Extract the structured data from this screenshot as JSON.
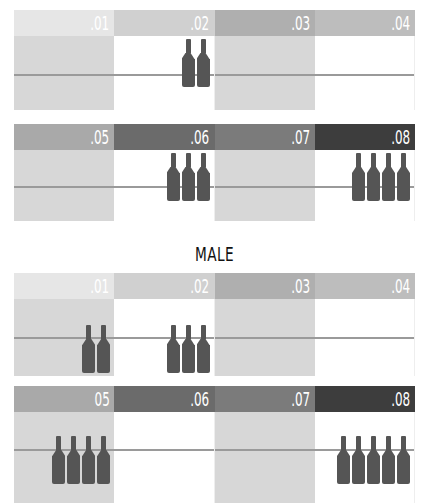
{
  "chart_data": [
    {
      "type": "pictogram",
      "title": "(clipped, unreadable)",
      "icon": "bottle-icon",
      "categories": [
        ".01",
        ".02",
        ".03",
        ".04",
        ".05",
        ".06",
        ".07",
        ".08"
      ],
      "values": [
        0,
        2,
        0,
        0,
        0,
        3,
        0,
        4
      ]
    },
    {
      "type": "pictogram",
      "title": "MALE",
      "icon": "bottle-icon",
      "categories": [
        ".01",
        ".02",
        ".03",
        ".04",
        ".05",
        ".06",
        ".07",
        ".08"
      ],
      "values": [
        2,
        3,
        0,
        0,
        4,
        0,
        0,
        5
      ]
    }
  ],
  "colors": {
    "bottle": "#555555",
    "shaded_body": "#d7d7d7",
    "midline": "#9a9a9a",
    "headers": [
      "#e6e6e6",
      "#d0d0d0",
      "#afafaf",
      "#bdbdbd",
      "#a9a9a9",
      "#6b6b6b",
      "#7b7b7b",
      "#3d3d3d"
    ]
  },
  "female": {
    "title": "",
    "row1": [
      {
        "label": ".01",
        "bottles": 0
      },
      {
        "label": ".02",
        "bottles": 2
      },
      {
        "label": ".03",
        "bottles": 0
      },
      {
        "label": ".04",
        "bottles": 0
      }
    ],
    "row2": [
      {
        "label": ".05",
        "bottles": 0
      },
      {
        "label": ".06",
        "bottles": 3
      },
      {
        "label": ".07",
        "bottles": 0
      },
      {
        "label": ".08",
        "bottles": 4
      }
    ]
  },
  "male": {
    "title": "MALE",
    "row1": [
      {
        "label": ".01",
        "bottles": 2
      },
      {
        "label": ".02",
        "bottles": 3
      },
      {
        "label": ".03",
        "bottles": 0
      },
      {
        "label": ".04",
        "bottles": 0
      }
    ],
    "row2": [
      {
        "label": "05",
        "bottles": 4
      },
      {
        "label": ".06",
        "bottles": 0
      },
      {
        "label": ".07",
        "bottles": 0
      },
      {
        "label": ".08",
        "bottles": 5
      }
    ]
  }
}
